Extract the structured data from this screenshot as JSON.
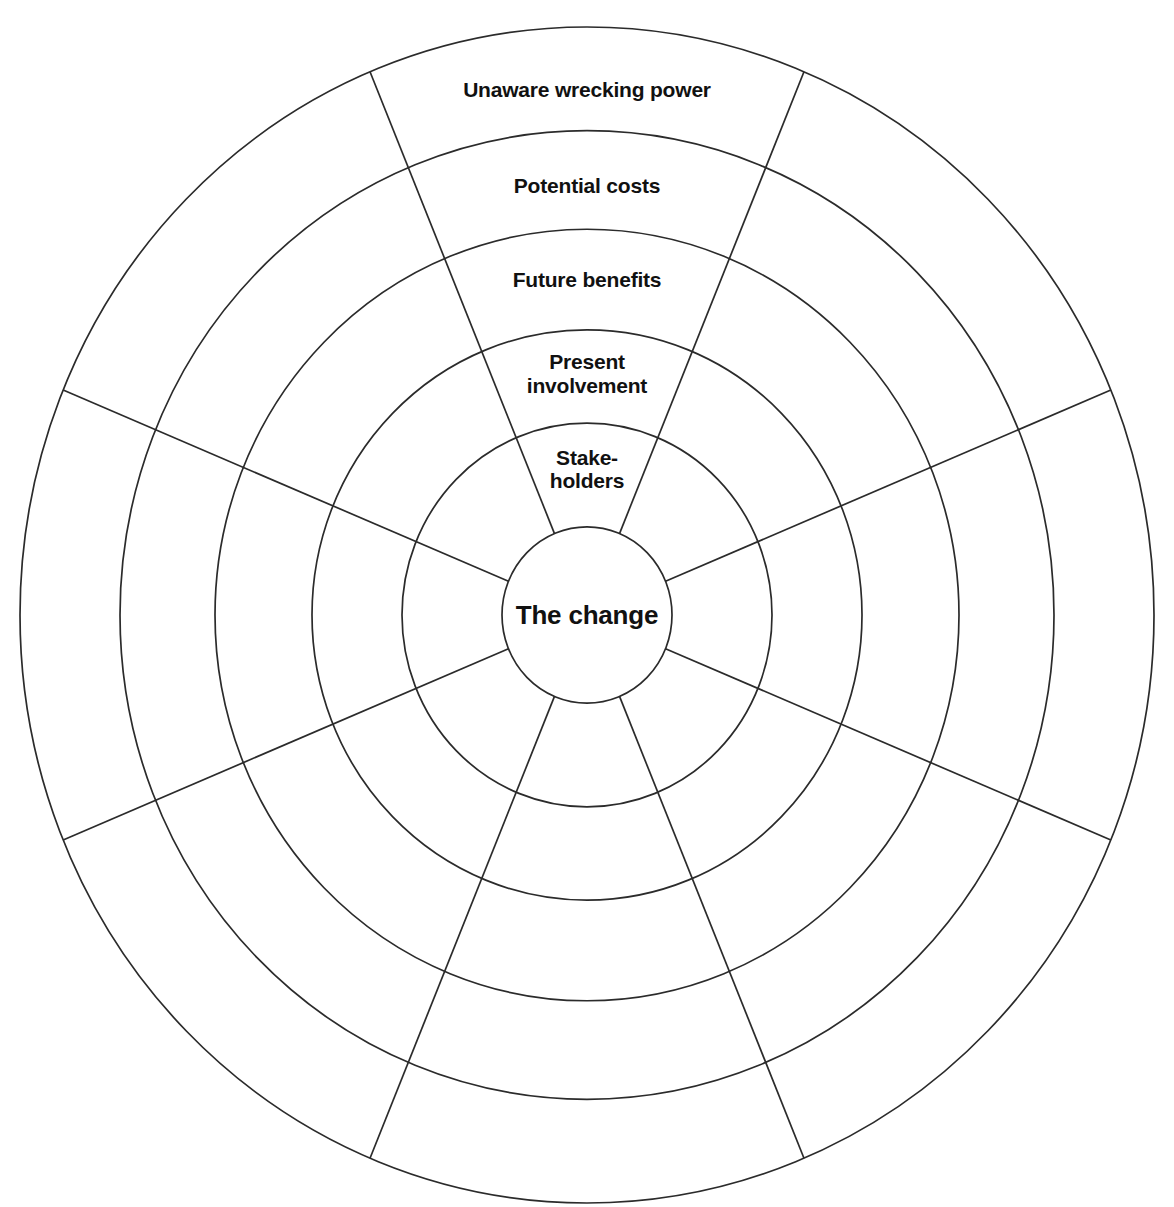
{
  "diagram": {
    "type": "concentric-ring-wheel",
    "title": "The change",
    "background_color": "#ffffff",
    "stroke_color": "#2b2b2b",
    "text_color": "#111111",
    "center": {
      "x": 587,
      "y": 615
    },
    "sector_count": 8,
    "sector_span_degrees": 45,
    "ring_count": 5,
    "hub": {
      "label": "The change",
      "radius": 85,
      "font_size": 26
    },
    "ring_boundary_radii": [
      85,
      185,
      275,
      372,
      467,
      567
    ],
    "rings": [
      {
        "index": 0,
        "label": "Stake-\nholders",
        "inner_radius": 85,
        "outer_radius": 185,
        "label_radius": 140,
        "font_size": 21
      },
      {
        "index": 1,
        "label": "Present\ninvolvement",
        "inner_radius": 185,
        "outer_radius": 275,
        "label_radius": 232,
        "font_size": 21
      },
      {
        "index": 2,
        "label": "Future benefits",
        "inner_radius": 275,
        "outer_radius": 372,
        "label_radius": 323,
        "font_size": 21
      },
      {
        "index": 3,
        "label": "Potential costs",
        "inner_radius": 372,
        "outer_radius": 467,
        "label_radius": 414,
        "font_size": 21
      },
      {
        "index": 4,
        "label": "Unaware wrecking power",
        "inner_radius": 467,
        "outer_radius": 567,
        "label_radius": 506,
        "font_size": 21
      }
    ],
    "spoke_angles_degrees": [
      22.5,
      67.5,
      112.5,
      157.5,
      202.5,
      247.5,
      292.5,
      337.5
    ]
  },
  "chart_data": {
    "type": "pie",
    "title": "The change",
    "categories": [
      "Stake-holders",
      "Present involvement",
      "Future benefits",
      "Potential costs",
      "Unaware wrecking power"
    ],
    "values": [
      1,
      1,
      1,
      1,
      1
    ],
    "xlabel": "",
    "ylabel": "",
    "legend": "none",
    "grid": true
  }
}
